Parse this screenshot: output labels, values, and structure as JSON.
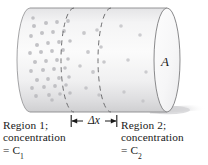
{
  "figure": {
    "background_color": "#ffffff",
    "ink_color": "#1a1a1a",
    "outline_color": "#7f7f7f",
    "body_fill_light": "#f2f2f2",
    "body_fill_dark": "#d9d9d9",
    "face_fill": "#fafafa",
    "dot_color": "#b9b9bd",
    "shadow_color": "#cfcfcf"
  },
  "labels": {
    "area": "A",
    "thickness": "Δx",
    "region1": {
      "line1": "Region 1;",
      "line2": "concentration",
      "line3_prefix": "= C",
      "line3_subscript": "1"
    },
    "region2": {
      "line1": "Region 2;",
      "line2": "concentration",
      "line3_prefix": "= C",
      "line3_subscript": "2"
    }
  },
  "diagram_data": {
    "type": "diagram",
    "subject": "Fick's law diffusion cylinder",
    "cylinder": {
      "left_face_center_x": 30,
      "right_face_center_x": 167,
      "face_radius_x": 13,
      "face_radius_y": 52,
      "center_y": 60
    },
    "cross_sections": [
      {
        "name": "dashed-section-1",
        "x": 74
      },
      {
        "name": "dashed-section-2",
        "x": 111
      }
    ],
    "slab": {
      "label": "Δx",
      "left_x": 74,
      "right_x": 111
    },
    "concentration_gradient": {
      "direction": "left-to-right decreasing",
      "region1_label": "C1",
      "region2_label": "C2",
      "dot_count_region1": 38,
      "dot_count_middle": 9,
      "dot_count_region2": 6
    },
    "dots_region1": [
      [
        34,
        26
      ],
      [
        46,
        23
      ],
      [
        57,
        22
      ],
      [
        68,
        21
      ],
      [
        31,
        36
      ],
      [
        42,
        33
      ],
      [
        53,
        32
      ],
      [
        64,
        31
      ],
      [
        37,
        45
      ],
      [
        48,
        43
      ],
      [
        59,
        42
      ],
      [
        70,
        41
      ],
      [
        30,
        53
      ],
      [
        41,
        52
      ],
      [
        52,
        51
      ],
      [
        63,
        50
      ],
      [
        35,
        62
      ],
      [
        46,
        61
      ],
      [
        57,
        60
      ],
      [
        68,
        59
      ],
      [
        31,
        71
      ],
      [
        43,
        70
      ],
      [
        54,
        69
      ],
      [
        65,
        68
      ],
      [
        37,
        80
      ],
      [
        48,
        79
      ],
      [
        59,
        78
      ],
      [
        69,
        77
      ],
      [
        32,
        88
      ],
      [
        44,
        87
      ],
      [
        55,
        86
      ],
      [
        66,
        85
      ],
      [
        36,
        96
      ],
      [
        49,
        95
      ],
      [
        60,
        94
      ],
      [
        70,
        93
      ],
      [
        33,
        18
      ],
      [
        52,
        100
      ]
    ],
    "dots_middle": [
      [
        84,
        33
      ],
      [
        97,
        30
      ],
      [
        88,
        52
      ],
      [
        101,
        47
      ],
      [
        80,
        66
      ],
      [
        93,
        72
      ],
      [
        104,
        62
      ],
      [
        86,
        88
      ],
      [
        99,
        95
      ]
    ],
    "dots_region2": [
      [
        121,
        26
      ],
      [
        140,
        35
      ],
      [
        128,
        60
      ],
      [
        146,
        72
      ],
      [
        124,
        92
      ],
      [
        143,
        101
      ]
    ]
  }
}
